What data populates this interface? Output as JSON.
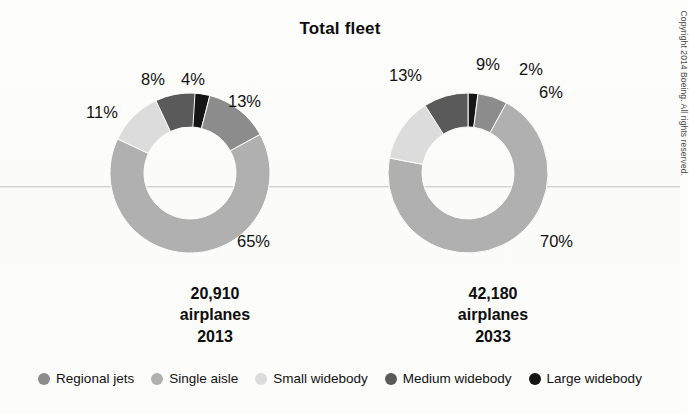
{
  "title": "Total fleet",
  "copyright": "Copyright 2014 Boeing. All rights reserved.",
  "legend": {
    "items": [
      {
        "label": "Regional jets",
        "color": "#8c8c8c"
      },
      {
        "label": "Single aisle",
        "color": "#b0b0b0"
      },
      {
        "label": "Small widebody",
        "color": "#dcdcdc"
      },
      {
        "label": "Medium widebody",
        "color": "#5a5a5a"
      },
      {
        "label": "Large widebody",
        "color": "#151515"
      }
    ]
  },
  "panels": {
    "left": {
      "count": "20,910",
      "unit": "airplanes",
      "year": "2013",
      "labels": {
        "medium_widebody": "8%",
        "large_widebody": "4%",
        "regional_jets": "13%",
        "single_aisle": "65%",
        "small_widebody": "11%"
      }
    },
    "right": {
      "count": "42,180",
      "unit": "airplanes",
      "year": "2033",
      "labels": {
        "medium_widebody": "9%",
        "large_widebody": "2%",
        "regional_jets": "6%",
        "single_aisle": "70%",
        "small_widebody": "13%"
      }
    }
  },
  "chart_data": {
    "type": "pie",
    "title": "Total fleet",
    "subtitle": "",
    "variant": "donut",
    "legend_position": "bottom",
    "grid": false,
    "charts": [
      {
        "name": "2013",
        "total_airplanes": 20910,
        "total_label": "20,910 airplanes 2013",
        "categories": [
          "Large widebody",
          "Regional jets",
          "Single aisle",
          "Small widebody",
          "Medium widebody"
        ],
        "values": [
          4,
          13,
          65,
          11,
          8
        ],
        "unit": "percent",
        "colors": [
          "#151515",
          "#8c8c8c",
          "#b0b0b0",
          "#dcdcdc",
          "#5a5a5a"
        ]
      },
      {
        "name": "2033",
        "total_airplanes": 42180,
        "total_label": "42,180 airplanes 2033",
        "categories": [
          "Large widebody",
          "Regional jets",
          "Single aisle",
          "Small widebody",
          "Medium widebody"
        ],
        "values": [
          2,
          6,
          70,
          13,
          9
        ],
        "unit": "percent",
        "colors": [
          "#151515",
          "#8c8c8c",
          "#b0b0b0",
          "#dcdcdc",
          "#5a5a5a"
        ]
      }
    ]
  }
}
